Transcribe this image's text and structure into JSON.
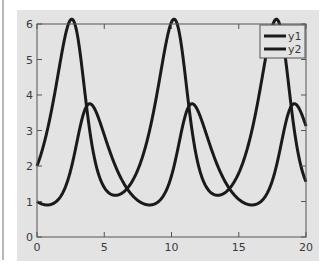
{
  "chart_data": {
    "type": "line",
    "title": "",
    "xlabel": "",
    "ylabel": "",
    "xlim": [
      0,
      20
    ],
    "ylim": [
      0,
      6
    ],
    "x_ticks": [
      0,
      5,
      10,
      15,
      20
    ],
    "y_ticks": [
      0,
      1,
      2,
      3,
      4,
      5,
      6
    ],
    "x_tick_labels": [
      "0",
      "5",
      "10",
      "15",
      "20"
    ],
    "y_tick_labels": [
      "0",
      "1",
      "2",
      "3",
      "4",
      "5",
      "6"
    ],
    "grid": false,
    "legend_position": "upper right",
    "x": [
      0,
      1,
      2,
      2.2,
      3,
      3.2,
      4,
      5,
      5.8,
      6,
      7,
      7.3,
      8,
      8.8,
      9,
      9.8,
      10,
      11,
      12,
      12.4,
      13,
      14,
      14.6,
      15,
      15.4,
      16,
      16.4,
      17,
      18,
      19,
      20
    ],
    "series": [
      {
        "name": "y1",
        "color": "#1a1a1a",
        "values": [
          2.0,
          3.6,
          5.3,
          5.4,
          3.4,
          2.7,
          1.5,
          1.1,
          1.05,
          1.07,
          1.3,
          1.45,
          2.1,
          4.3,
          5.2,
          5.4,
          4.6,
          2.2,
          1.3,
          1.1,
          1.05,
          1.3,
          1.8,
          2.6,
          4.2,
          5.3,
          5.4,
          3.4,
          1.6,
          1.2,
          1.75
        ]
      },
      {
        "name": "y2",
        "color": "#1a1a1a",
        "values": [
          1.0,
          1.1,
          2.3,
          2.8,
          3.55,
          3.6,
          3.1,
          2.1,
          1.5,
          1.35,
          1.0,
          0.95,
          1.0,
          1.5,
          1.8,
          3.2,
          3.6,
          3.0,
          1.9,
          1.6,
          1.3,
          1.0,
          0.95,
          1.0,
          1.1,
          1.9,
          2.6,
          3.6,
          2.6,
          1.6,
          1.05
        ]
      }
    ],
    "model": {
      "a": 1.0,
      "b": 0.5,
      "c": 0.75,
      "d": 0.25,
      "y1_0": 2.0,
      "y2_0": 1.0,
      "t_end": 20
    }
  },
  "legend": {
    "items": [
      {
        "label": "y1"
      },
      {
        "label": "y2"
      }
    ]
  }
}
